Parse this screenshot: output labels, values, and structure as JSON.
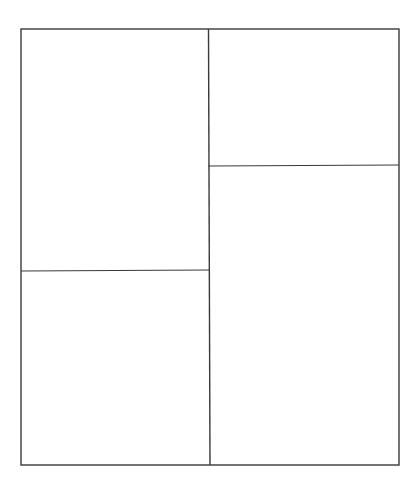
{
  "diagram": {
    "type": "panel-layout",
    "stroke_color": "#3a3a3a",
    "background": "#ffffff",
    "outer_frame": {
      "x1": 21,
      "y1": 29,
      "x2": 399,
      "y2": 465
    },
    "dividers": [
      {
        "name": "vertical-center-divider",
        "x1": 208.5,
        "y1": 29,
        "x2": 210,
        "y2": 465
      },
      {
        "name": "left-horizontal-divider",
        "x1": 21,
        "y1": 271,
        "x2": 209.5,
        "y2": 270
      },
      {
        "name": "right-horizontal-divider",
        "x1": 208.5,
        "y1": 166,
        "x2": 399,
        "y2": 165
      }
    ],
    "panels": [
      {
        "name": "panel-top-left",
        "label": ""
      },
      {
        "name": "panel-bottom-left",
        "label": ""
      },
      {
        "name": "panel-top-right",
        "label": ""
      },
      {
        "name": "panel-bottom-right",
        "label": ""
      }
    ]
  }
}
